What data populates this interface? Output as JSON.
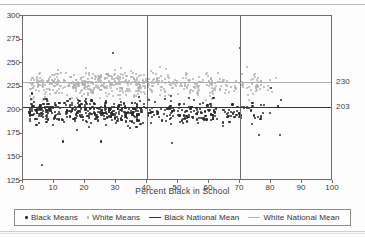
{
  "chart_data": {
    "type": "scatter",
    "title": "",
    "xlabel": "Percent Black in School",
    "ylabel": "",
    "xlim": [
      0,
      100
    ],
    "ylim": [
      125,
      300
    ],
    "xticks": [
      0,
      10,
      20,
      30,
      40,
      50,
      60,
      70,
      80,
      90,
      100
    ],
    "yticks": [
      125,
      150,
      175,
      200,
      225,
      250,
      275,
      300
    ],
    "grid": false,
    "legend_position": "bottom",
    "series": [
      {
        "name": "Black Means",
        "marker": "dot",
        "color": "#2a2a2a",
        "note": "Mean score of Black students by school, clustered near 195-205",
        "x_range": [
          2,
          84
        ],
        "y_center": 198,
        "y_spread": [
          142,
          262
        ],
        "n_points": 520
      },
      {
        "name": "White Means",
        "marker": "dot",
        "color": "#b0b0b0",
        "note": "Mean score of White students by school, clustered near 225-232",
        "x_range": [
          2,
          82
        ],
        "y_center": 228,
        "y_spread": [
          190,
          268
        ],
        "n_points": 560
      }
    ],
    "reference_lines": [
      {
        "name": "Black National Mean",
        "orientation": "horizontal",
        "value": 203,
        "color": "#333333",
        "label": "203"
      },
      {
        "name": "White National Mean",
        "orientation": "horizontal",
        "value": 230,
        "color": "#adadad",
        "label": "230"
      },
      {
        "name": "marker-40",
        "orientation": "vertical",
        "value": 40,
        "color": "#6d6d6d",
        "label": ""
      },
      {
        "name": "marker-70",
        "orientation": "vertical",
        "value": 70,
        "color": "#6d6d6d",
        "label": ""
      }
    ],
    "right_axis_labels": [
      "230",
      "203"
    ]
  },
  "legend": {
    "items": [
      {
        "label": "Black Means",
        "swatch": "dot-black"
      },
      {
        "label": "White Means",
        "swatch": "dot-white"
      },
      {
        "label": "Black National Mean",
        "swatch": "line-black"
      },
      {
        "label": "White National Mean",
        "swatch": "line-white"
      }
    ]
  },
  "axis": {
    "x_title": "Percent Black in School",
    "x_tick_labels": [
      "0",
      "10",
      "20",
      "30",
      "40",
      "50",
      "60",
      "70",
      "80",
      "90",
      "100"
    ],
    "y_tick_labels": [
      "300",
      "275",
      "250",
      "225",
      "200",
      "175",
      "150",
      "125"
    ]
  },
  "callouts": {
    "white_mean": "230",
    "black_mean": "203"
  }
}
